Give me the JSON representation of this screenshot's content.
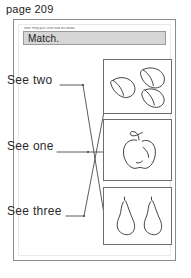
{
  "page": {
    "label": "page 209"
  },
  "worksheet": {
    "fine_print": "Note: Help your child read the words.",
    "title": "Match.",
    "prompts": [
      {
        "text": "See two",
        "name": "see-two"
      },
      {
        "text": "See one",
        "name": "see-one"
      },
      {
        "text": "See three",
        "name": "see-three"
      }
    ],
    "picture_boxes": [
      {
        "name": "bananas",
        "item": "banana",
        "count": 3
      },
      {
        "name": "apple",
        "item": "apple",
        "count": 1
      },
      {
        "name": "pears",
        "item": "pear",
        "count": 2
      }
    ],
    "connections": [
      {
        "from": "see-two",
        "to": "pears"
      },
      {
        "from": "see-one",
        "to": "apple"
      },
      {
        "from": "see-three",
        "to": "bananas"
      }
    ]
  },
  "colors": {
    "banner_fill": "#d6d6d6",
    "banner_border": "#9a9a9a",
    "sheet_border": "#8d8d8d",
    "box_border": "#6d6d6d",
    "ink": "#2a2a2a",
    "line": "#4a4a4a"
  }
}
